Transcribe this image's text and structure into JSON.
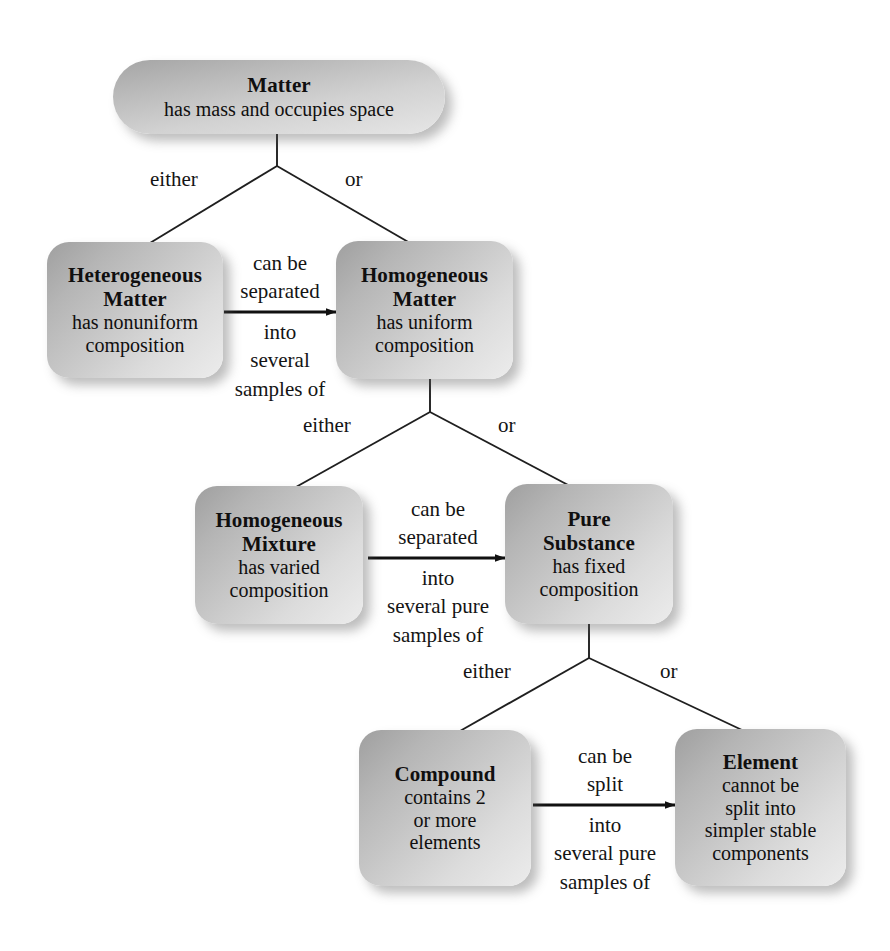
{
  "diagram": {
    "colors": {
      "box_gradient_dark": "#9f9f9f",
      "box_gradient_light": "#ececec",
      "text": "#100f0f",
      "connector": "#1a1a1a",
      "background": "#ffffff"
    },
    "nodes": [
      {
        "id": "matter",
        "title": "Matter",
        "desc": [
          "has mass and occupies space"
        ]
      },
      {
        "id": "heterogeneous-matter",
        "title": "Heterogeneous",
        "title2": "Matter",
        "desc": [
          "has nonuniform",
          "composition"
        ]
      },
      {
        "id": "homogeneous-matter",
        "title": "Homogeneous",
        "title2": "Matter",
        "desc": [
          "has uniform",
          "composition"
        ]
      },
      {
        "id": "homogeneous-mixture",
        "title": "Homogeneous",
        "title2": "Mixture",
        "desc": [
          "has varied",
          "composition"
        ]
      },
      {
        "id": "pure-substance",
        "title": "Pure",
        "title2": "Substance",
        "desc": [
          "has fixed",
          "composition"
        ]
      },
      {
        "id": "compound",
        "title": "Compound",
        "desc": [
          "contains 2",
          "or more",
          "elements"
        ]
      },
      {
        "id": "element",
        "title": "Element",
        "desc": [
          "cannot be",
          "split into",
          "simpler stable",
          "components"
        ]
      }
    ],
    "branches": [
      {
        "id": "fork-1-left",
        "label": "either"
      },
      {
        "id": "fork-1-right",
        "label": "or"
      },
      {
        "id": "fork-2-left",
        "label": "either"
      },
      {
        "id": "fork-2-right",
        "label": "or"
      },
      {
        "id": "fork-3-left",
        "label": "either"
      },
      {
        "id": "fork-3-right",
        "label": "or"
      }
    ],
    "arrows": [
      {
        "id": "arrow-het-to-hom",
        "from": "heterogeneous-matter",
        "to": "homogeneous-matter",
        "above": [
          "can be",
          "separated"
        ],
        "below": [
          "into",
          "several",
          "samples of"
        ]
      },
      {
        "id": "arrow-mixture-to-pure",
        "from": "homogeneous-mixture",
        "to": "pure-substance",
        "above": [
          "can be",
          "separated"
        ],
        "below": [
          "into",
          "several pure",
          "samples of"
        ]
      },
      {
        "id": "arrow-compound-to-element",
        "from": "compound",
        "to": "element",
        "above": [
          "can be",
          "split"
        ],
        "below": [
          "into",
          "several pure",
          "samples of"
        ]
      }
    ]
  }
}
